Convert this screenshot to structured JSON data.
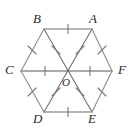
{
  "figure": {
    "background_color": "#ffffff",
    "stroke_color_edges": "#8c8c8c",
    "stroke_color_diagonals": "#6e6e6e",
    "label_color": "#2b2b2b",
    "canvas": {
      "width": 137,
      "height": 134
    }
  },
  "labels": {
    "A": "A",
    "B": "B",
    "C": "C",
    "D": "D",
    "E": "E",
    "F": "F",
    "O": "O"
  },
  "geometry": {
    "center": {
      "name": "O",
      "x": 68,
      "y": 71
    },
    "vertices": [
      {
        "name": "B",
        "x": 44,
        "y": 29
      },
      {
        "name": "A",
        "x": 92,
        "y": 29
      },
      {
        "name": "F",
        "x": 112,
        "y": 71
      },
      {
        "name": "E",
        "x": 92,
        "y": 112
      },
      {
        "name": "D",
        "x": 44,
        "y": 112
      },
      {
        "name": "C",
        "x": 21,
        "y": 71
      }
    ],
    "edges": [
      {
        "from": "B",
        "to": "A",
        "ticks": 1
      },
      {
        "from": "A",
        "to": "F",
        "ticks": 1
      },
      {
        "from": "F",
        "to": "E",
        "ticks": 1
      },
      {
        "from": "E",
        "to": "D",
        "ticks": 1
      },
      {
        "from": "D",
        "to": "C",
        "ticks": 1
      },
      {
        "from": "C",
        "to": "B",
        "ticks": 1
      }
    ],
    "radii": [
      {
        "from": "O",
        "to": "A",
        "ticks": 1
      },
      {
        "from": "O",
        "to": "B",
        "ticks": 1
      },
      {
        "from": "O",
        "to": "C",
        "ticks": 1
      },
      {
        "from": "O",
        "to": "D",
        "ticks": 1
      },
      {
        "from": "O",
        "to": "E",
        "ticks": 1
      },
      {
        "from": "O",
        "to": "F",
        "ticks": 1
      }
    ],
    "diagonals": [
      {
        "from": "C",
        "to": "F"
      },
      {
        "from": "B",
        "to": "E"
      },
      {
        "from": "A",
        "to": "D"
      }
    ]
  },
  "label_positions": {
    "A": {
      "x": 92,
      "y": 12
    },
    "B": {
      "x": 38,
      "y": 12
    },
    "C": {
      "x": 8,
      "y": 64
    },
    "D": {
      "x": 38,
      "y": 115
    },
    "E": {
      "x": 89,
      "y": 115
    },
    "F": {
      "x": 118,
      "y": 64
    },
    "O": {
      "x": 64,
      "y": 80
    }
  }
}
